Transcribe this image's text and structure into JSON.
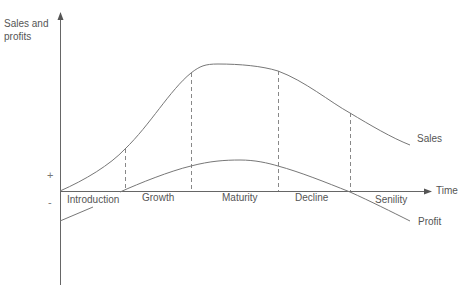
{
  "diagram": {
    "y_axis_label": "Sales and profits",
    "x_axis_label": "Time",
    "plus_sign": "+",
    "minus_sign": "-",
    "curves": {
      "sales_label": "Sales",
      "profit_label": "Profit"
    },
    "stages": [
      {
        "label": "Introduction"
      },
      {
        "label": "Growth"
      },
      {
        "label": "Maturity"
      },
      {
        "label": "Decline"
      },
      {
        "label": "Senility"
      }
    ],
    "colors": {
      "line": "#777777",
      "axis": "#666666",
      "text": "#555555"
    }
  }
}
